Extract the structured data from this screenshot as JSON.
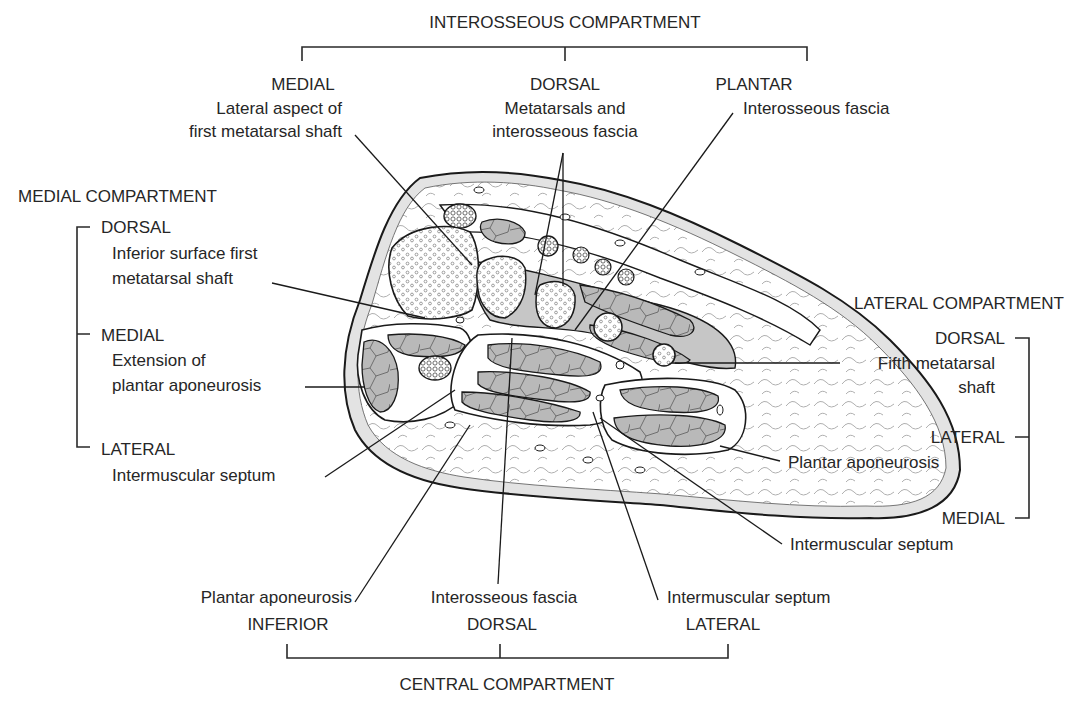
{
  "colors": {
    "outline": "#1a1a1a",
    "fat_layer": "#e6e6e6",
    "muscle": "#b8b8b8",
    "background": "#ffffff"
  },
  "interosseous": {
    "header": "INTEROSSEOUS COMPARTMENT",
    "medial": {
      "title": "MEDIAL",
      "line1": "Lateral aspect of",
      "line2": "first metatarsal shaft"
    },
    "dorsal": {
      "title": "DORSAL",
      "line1": "Metatarsals and",
      "line2": "interosseous fascia"
    },
    "plantar": {
      "title": "PLANTAR",
      "line1": "Interosseous fascia"
    }
  },
  "medial_compartment": {
    "header": "MEDIAL COMPARTMENT",
    "dorsal": {
      "title": "DORSAL",
      "line1": "Inferior surface first",
      "line2": "metatarsal shaft"
    },
    "medial": {
      "title": "MEDIAL",
      "line1": "Extension of",
      "line2": "plantar aponeurosis"
    },
    "lateral": {
      "title": "LATERAL",
      "line1": "Intermuscular septum"
    }
  },
  "lateral_compartment": {
    "header": "LATERAL COMPARTMENT",
    "dorsal": {
      "title": "DORSAL",
      "line1": "Fifth metatarsal",
      "line2": "shaft"
    },
    "lateral": {
      "title": "LATERAL",
      "line1": "Plantar aponeurosis"
    },
    "medial": {
      "title": "MEDIAL",
      "line1": "Intermuscular septum"
    }
  },
  "central_compartment": {
    "header": "CENTRAL COMPARTMENT",
    "inferior": {
      "title": "INFERIOR",
      "line1": "Plantar aponeurosis"
    },
    "dorsal": {
      "title": "DORSAL",
      "line1": "Interosseous fascia"
    },
    "lateral": {
      "title": "LATERAL",
      "line1": "Intermuscular septum"
    }
  }
}
